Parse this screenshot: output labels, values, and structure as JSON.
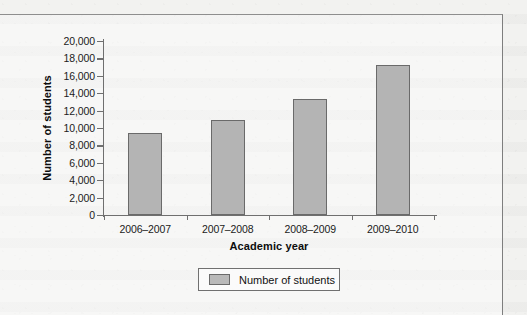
{
  "chart_data": {
    "type": "bar",
    "title": "",
    "subtitle": "",
    "xlabel": "Academic year",
    "ylabel": "Number of students",
    "categories": [
      "2006–2007",
      "2007–2008",
      "2008–2009",
      "2009–2010"
    ],
    "values": [
      9400,
      10900,
      13300,
      17200
    ],
    "series": [
      {
        "name": "Number of students",
        "values": [
          9400,
          10900,
          13300,
          17200
        ]
      }
    ],
    "ylim": [
      0,
      20000
    ],
    "ytick_values": [
      0,
      2000,
      4000,
      6000,
      8000,
      10000,
      12000,
      14000,
      16000,
      18000,
      20000
    ],
    "ytick_labels": [
      "0",
      "2,000",
      "4,000",
      "6,000",
      "8,000",
      "10,000",
      "12,000",
      "14,000",
      "16,000",
      "18,000",
      "20,000"
    ],
    "grid": false,
    "legend": {
      "position": "bottom",
      "entries": [
        "Number of students"
      ]
    },
    "colors": {
      "bar_fill": "#b4b4b4",
      "bar_border": "#6a6a6a",
      "axis": "#6f6f6f",
      "text": "#1b1b1b",
      "frame": "#7e7e7e",
      "page_background": "#f2f2f0"
    }
  }
}
